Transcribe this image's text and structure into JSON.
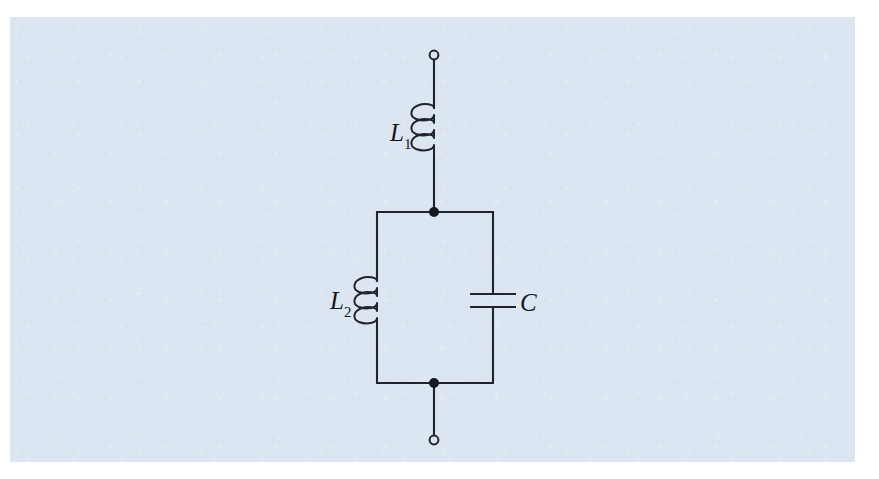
{
  "figure": {
    "kind": "electrical-circuit-schematic",
    "background_color": "#dce6f2",
    "page_color": "#ffffff",
    "wire_color": "#20242c",
    "label_color": "#14161a"
  },
  "labels": {
    "l1": {
      "symbol": "L",
      "subscript": "1"
    },
    "l2": {
      "symbol": "L",
      "subscript": "2"
    },
    "c": {
      "symbol": "C",
      "subscript": ""
    }
  },
  "components": [
    {
      "id": "l1",
      "type": "inductor",
      "label": "L1",
      "orientation": "vertical",
      "coils": 3,
      "branch": "series-top",
      "x": 434,
      "y_start": 108,
      "y_end": 157
    },
    {
      "id": "l2",
      "type": "inductor",
      "label": "L2",
      "orientation": "vertical",
      "coils": 3,
      "branch": "parallel-left",
      "x": 377,
      "y_start": 281,
      "y_end": 325
    },
    {
      "id": "c",
      "type": "capacitor",
      "label": "C",
      "orientation": "vertical",
      "plates": 2,
      "branch": "parallel-right",
      "x": 493,
      "y_top_plate": 294,
      "y_bottom_plate": 307
    }
  ],
  "terminals": [
    {
      "id": "terminal-top",
      "style": "open-circle",
      "x": 434,
      "y": 55
    },
    {
      "id": "terminal-bottom",
      "style": "open-circle",
      "x": 434,
      "y": 440
    }
  ],
  "nodes": [
    {
      "id": "node-top",
      "style": "filled-dot",
      "x": 434,
      "y": 212
    },
    {
      "id": "node-bottom",
      "style": "filled-dot",
      "x": 434,
      "y": 383
    }
  ],
  "geometry": {
    "main_axis_x": 434,
    "parallel_left_x": 377,
    "parallel_right_x": 493,
    "parallel_top_y": 212,
    "parallel_bottom_y": 383
  },
  "label_positions": {
    "l1": {
      "x": 390,
      "y": 120
    },
    "l2": {
      "x": 330,
      "y": 288
    },
    "c": {
      "x": 520,
      "y": 290
    }
  }
}
